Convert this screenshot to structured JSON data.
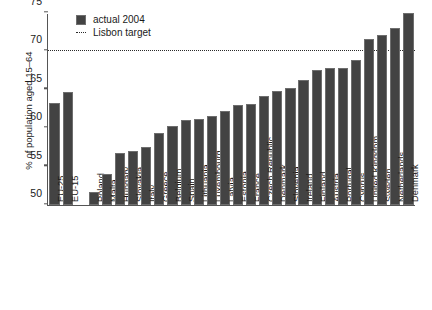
{
  "chart_data": {
    "type": "bar",
    "title": "",
    "xlabel": "",
    "ylabel": "% of population aged 15–64",
    "ylim": [
      50,
      75
    ],
    "yticks": [
      50,
      55,
      60,
      65,
      70,
      75
    ],
    "grid": false,
    "legend_position": "top-left",
    "legend": [
      {
        "label": "actual 2004",
        "marker": "filled-square",
        "color": "#434343"
      },
      {
        "label": "Lisbon target",
        "marker": "dotted-line",
        "color": "#2a2a2a"
      }
    ],
    "annotations": [
      {
        "type": "hline",
        "label": "Lisbon target",
        "value": 70
      }
    ],
    "series": [
      {
        "name": "actual 2004",
        "color": "#434343",
        "categories": [
          "EU-25",
          "EU-15",
          "",
          "Poland",
          "Malta",
          "Hungary",
          "Slovakia",
          "Italy",
          "Greece",
          "Belgium",
          "Spain",
          "Lithuania",
          "Luxembourg",
          "Latvia",
          "Estonia",
          "France",
          "Czech Republic",
          "Denmark",
          "Slovenia",
          "Ireland",
          "Finland",
          "Austria",
          "Portugal",
          "Cyprus",
          "United Kingdom",
          "Sweden",
          "Netherlands",
          "Denmark"
        ],
        "values": [
          63.3,
          64.7,
          null,
          51.7,
          54.1,
          56.8,
          57.0,
          57.6,
          59.4,
          60.3,
          61.1,
          61.2,
          61.6,
          62.3,
          63.0,
          63.1,
          64.2,
          64.8,
          65.3,
          66.3,
          67.6,
          67.8,
          67.8,
          68.9,
          71.6,
          72.1,
          73.1,
          75.0
        ]
      }
    ]
  }
}
